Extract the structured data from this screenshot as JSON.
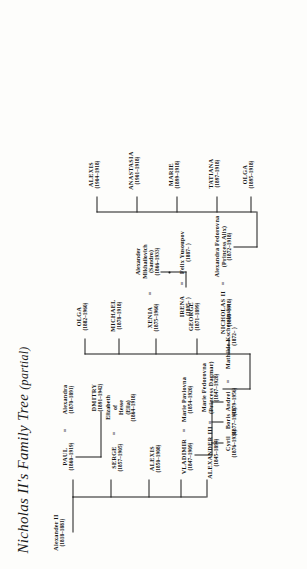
{
  "document": {
    "title_main": "Nicholas II's Family Tree",
    "title_paren": "(partial)",
    "type": "genealogy-chart",
    "ink_color": "#1b1b1b",
    "paper_color": "#fdfdfb"
  },
  "people": {
    "alexander_ii": {
      "name": "Alexander II",
      "years": "(1818–1881)"
    },
    "alexander_iii": {
      "name": "ALEXANDER III",
      "years": "(1845–1894)"
    },
    "marie_fedorovna": {
      "name": "Marie Fedorovna",
      "alias": "(Princess Dagmar)",
      "years": "(1847–1928)"
    },
    "vladimir": {
      "name": "VLADIMIR",
      "years": "(1847–1909)"
    },
    "marie_pavlovna": {
      "name": "Marie Pavlovna",
      "years": "(1854–1920)"
    },
    "alexis": {
      "name": "ALEXIS",
      "years": "(1850–1908)"
    },
    "serge": {
      "name": "SERGE",
      "years": "(1857–1905)"
    },
    "elizabeth_hesse": {
      "name": "Elizabeth",
      "line2": "of",
      "line3": "Hesse",
      "line4": "(Ella)",
      "years": "(1864–1918)"
    },
    "paul": {
      "name": "PAUL",
      "years": "(1860–1919)"
    },
    "alexandra_paul": {
      "name": "Alexandra",
      "years": "(1870–1891)"
    },
    "cyril": {
      "name": "Cyril",
      "years": "(1876–1938)"
    },
    "boris": {
      "name": "Boris",
      "years": "(1877–1943)"
    },
    "andrei": {
      "name": "Andrei",
      "years": "(1879–1956)"
    },
    "mathilde": {
      "name": "Mathilde Kschessinska",
      "years": "(1872–   )"
    },
    "dmitry": {
      "name": "DMITRY",
      "years": "(1891–1942)"
    },
    "nicholas_ii": {
      "name": "NICHOLAS II",
      "years": "(1868–1918)"
    },
    "alexandra_alix": {
      "name": "Alexandra Fedorovna",
      "alias": "(Princess Alix)",
      "years": "(1872–1918)"
    },
    "george": {
      "name": "GEORGE",
      "years": "(1871–1899)"
    },
    "xenia": {
      "name": "XENIA",
      "years": "(1875–1960)"
    },
    "sandro": {
      "name": "Alexander",
      "line2": "Mikhailovich",
      "line3": "(Sandro)",
      "years": "(1866–1933)"
    },
    "michael": {
      "name": "MICHAEL",
      "years": "(1878–1918)"
    },
    "olga_sister": {
      "name": "OLGA",
      "years": "(1882–1960)"
    },
    "irena": {
      "name": "IRENA",
      "years": "(1895–   )"
    },
    "felix": {
      "name": "Felix Yusoupov",
      "years": "(1887–   )"
    },
    "olga_child": {
      "name": "OLGA",
      "years": "(1895–1918)"
    },
    "tatiana": {
      "name": "TATIANA",
      "years": "(1897–1918)"
    },
    "marie_child": {
      "name": "MARIE",
      "years": "(1899–1918)"
    },
    "anastasia": {
      "name": "ANASTASIA",
      "years": "(1901–1918)"
    },
    "alexis_child": {
      "name": "ALEXIS",
      "years": "(1904–1918)"
    }
  },
  "marriage_symbol": "="
}
